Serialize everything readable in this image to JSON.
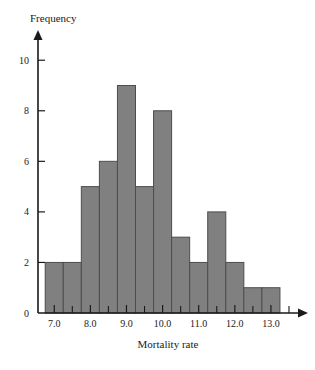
{
  "chart_data": {
    "type": "bar",
    "title": "",
    "xlabel": "Mortality rate",
    "ylabel": "Frequency",
    "xlim": [
      6.55,
      13.75
    ],
    "ylim": [
      0,
      10.8
    ],
    "grid": false,
    "legend": null,
    "bin_width": 0.5,
    "bin_edges": [
      6.75,
      7.25,
      7.75,
      8.25,
      8.75,
      9.25,
      9.75,
      10.25,
      10.75,
      11.25,
      11.75,
      12.25,
      12.75,
      13.25
    ],
    "categories": [
      "6.75-7.25",
      "7.25-7.75",
      "7.75-8.25",
      "8.25-8.75",
      "8.75-9.25",
      "9.25-9.75",
      "9.75-10.25",
      "10.25-10.75",
      "10.75-11.25",
      "11.25-11.75",
      "11.75-12.25",
      "12.25-12.75",
      "12.75-13.25"
    ],
    "values": [
      2,
      2,
      5,
      6,
      9,
      5,
      8,
      3,
      2,
      4,
      2,
      1,
      1
    ],
    "x_ticks": [
      7.0,
      8.0,
      9.0,
      10.0,
      11.0,
      12.0,
      13.0
    ],
    "x_tick_labels": [
      "7.0",
      "8.0",
      "9.0",
      "10.0",
      "11.0",
      "12.0",
      "13.0"
    ],
    "y_ticks": [
      0,
      2,
      4,
      6,
      8,
      10
    ],
    "y_tick_labels": [
      "0",
      "2",
      "4",
      "6",
      "8",
      "10"
    ],
    "bar_fill_color": "#808080",
    "bar_edge_color": "#4d4d4d",
    "axis_color": "#1a1a1a"
  }
}
